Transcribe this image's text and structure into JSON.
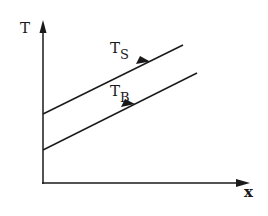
{
  "diagram": {
    "axes": {
      "y_label": "T",
      "x_label": "x"
    },
    "lines": [
      {
        "name": "T_S",
        "label_main": "T",
        "label_sub": "S",
        "description": "upper line, direction arrow pointing up-right"
      },
      {
        "name": "T_B",
        "label_main": "T",
        "label_sub": "B",
        "description": "lower line, direction arrow pointing up-right"
      }
    ],
    "colors": {
      "stroke": "#1a1a1a",
      "background": "#ffffff"
    }
  }
}
